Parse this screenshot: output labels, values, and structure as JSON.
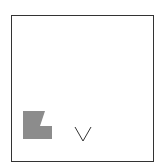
{
  "canvas": {
    "border_color": "#333333",
    "background": "#ffffff"
  },
  "items": [
    {
      "kind": "polygon-shape",
      "fill": "#8c8c8c"
    },
    {
      "kind": "v-glyph",
      "stroke": "#333333"
    }
  ]
}
